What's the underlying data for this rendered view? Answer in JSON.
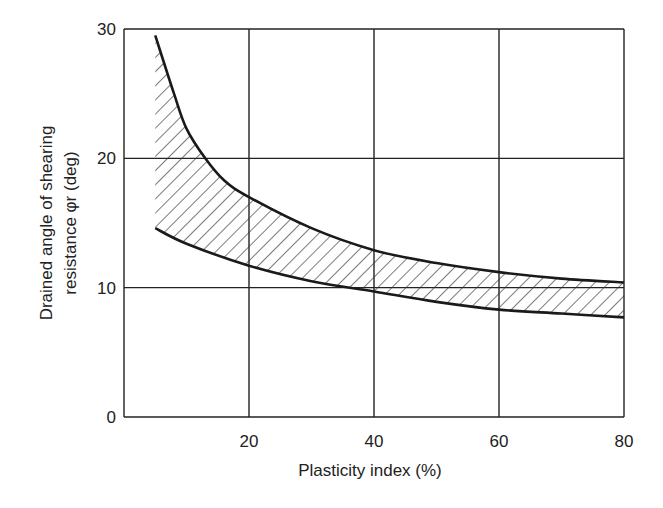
{
  "chart_data": {
    "type": "area",
    "title": "",
    "xlabel": "Plasticity index (%)",
    "ylabel_line1": "Drained angle of shearing",
    "ylabel_line2": "resistance φr (deg)",
    "xlim": [
      0,
      80
    ],
    "ylim": [
      0,
      30
    ],
    "x_ticks": [
      "20",
      "40",
      "60",
      "80"
    ],
    "y_ticks": [
      "0",
      "10",
      "20",
      "30"
    ],
    "grid": true,
    "legend": "none",
    "series": [
      {
        "name": "Upper bound",
        "x": [
          5,
          8,
          10,
          13,
          16,
          20,
          30,
          40,
          50,
          60,
          70,
          80
        ],
        "values": [
          29.5,
          25.0,
          22.3,
          20.0,
          18.3,
          17.0,
          14.6,
          12.9,
          11.9,
          11.2,
          10.7,
          10.4
        ]
      },
      {
        "name": "Lower bound",
        "x": [
          5,
          10,
          20,
          30,
          40,
          50,
          60,
          70,
          80
        ],
        "values": [
          14.6,
          13.4,
          11.7,
          10.5,
          9.7,
          8.9,
          8.3,
          8.0,
          7.7
        ]
      }
    ],
    "fill": "hatched region between upper and lower bounds"
  },
  "colors": {
    "line": "#1a1a1a",
    "grid": "#222222",
    "hatch": "#333333",
    "background": "#ffffff"
  }
}
